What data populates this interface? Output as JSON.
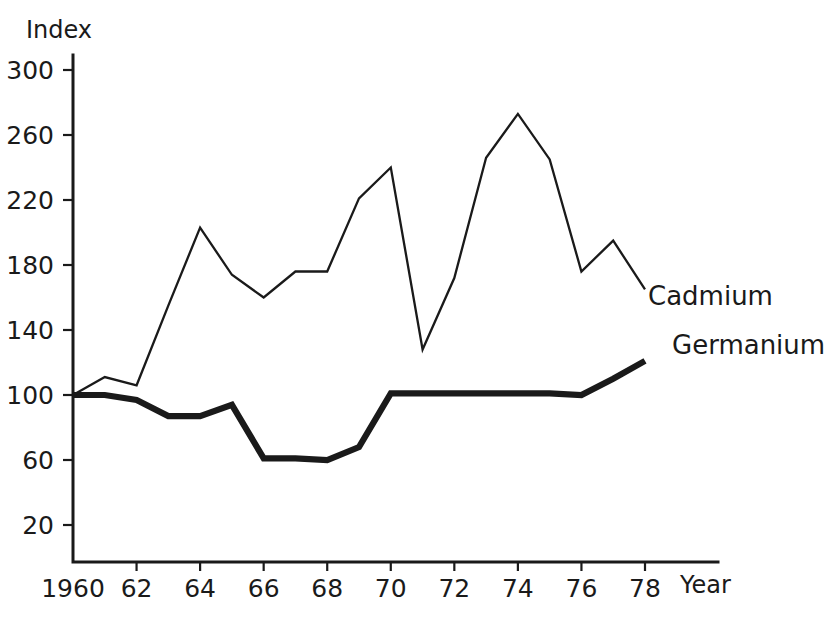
{
  "chart_data": {
    "type": "line",
    "title": "",
    "xlabel": "Year",
    "ylabel": "Index",
    "grid": false,
    "legend_position": "inline-right-of-line-ends",
    "xlim": [
      1960,
      1978
    ],
    "ylim": [
      0,
      320
    ],
    "y_ticks": [
      300,
      260,
      220,
      180,
      140,
      100,
      60,
      20
    ],
    "y_tick_labels": [
      "300",
      "260",
      "220",
      "180",
      "140",
      "100",
      "60",
      "20"
    ],
    "x_ticks": [
      1960,
      1962,
      1964,
      1966,
      1968,
      1970,
      1972,
      1974,
      1976,
      1978
    ],
    "x_tick_labels": [
      "1960",
      "62",
      "64",
      "66",
      "68",
      "70",
      "72",
      "74",
      "76",
      "78"
    ],
    "x": [
      1960,
      1961,
      1962,
      1963,
      1964,
      1965,
      1966,
      1967,
      1968,
      1969,
      1970,
      1971,
      1972,
      1973,
      1974,
      1975,
      1976,
      1977,
      1978
    ],
    "series": [
      {
        "name": "Cadmium",
        "style": "thin",
        "values": [
          100,
          111,
          106,
          155,
          203,
          174,
          160,
          176,
          176,
          221,
          240,
          128,
          172,
          246,
          273,
          245,
          176,
          195,
          165
        ]
      },
      {
        "name": "Germanium",
        "style": "thick",
        "values": [
          100,
          100,
          97,
          87,
          87,
          94,
          61,
          61,
          60,
          68,
          101,
          101,
          101,
          101,
          101,
          101,
          100,
          110,
          121
        ]
      }
    ]
  },
  "labels": {
    "y_axis_title": "Index",
    "x_axis_title": "Year",
    "series_cadmium": "Cadmium",
    "series_germanium": "Germanium"
  },
  "colors": {
    "ink": "#1a1a1a",
    "background": "#ffffff"
  }
}
